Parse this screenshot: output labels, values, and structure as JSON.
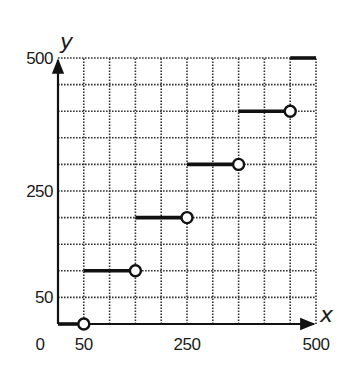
{
  "chart_data": {
    "type": "line",
    "subtype": "step-function",
    "title": "",
    "xlabel": "x",
    "ylabel": "y",
    "xlim": [
      0,
      500
    ],
    "ylim": [
      0,
      500
    ],
    "grid": true,
    "grid_spacing": 50,
    "grid_style": "dotted",
    "x_tick_labels": [
      "0",
      "50",
      "250",
      "500"
    ],
    "x_tick_values": [
      0,
      50,
      250,
      500
    ],
    "y_tick_labels": [
      "50",
      "250",
      "500"
    ],
    "y_tick_values": [
      50,
      250,
      500
    ],
    "segments": [
      {
        "x_start": 0,
        "x_end": 50,
        "y": 0,
        "start": "closed",
        "end": "open"
      },
      {
        "x_start": 50,
        "x_end": 150,
        "y": 100,
        "start": "closed",
        "end": "open"
      },
      {
        "x_start": 150,
        "x_end": 250,
        "y": 200,
        "start": "closed",
        "end": "open"
      },
      {
        "x_start": 250,
        "x_end": 350,
        "y": 300,
        "start": "closed",
        "end": "open"
      },
      {
        "x_start": 350,
        "x_end": 450,
        "y": 400,
        "start": "closed",
        "end": "open"
      },
      {
        "x_start": 450,
        "x_end": 500,
        "y": 500,
        "start": "closed",
        "end": "none"
      }
    ],
    "legend": null
  },
  "labels": {
    "x_axis": "x",
    "y_axis": "y",
    "origin": "0"
  },
  "colors": {
    "line": "#111111",
    "grid": "#333333",
    "background": "#ffffff"
  }
}
